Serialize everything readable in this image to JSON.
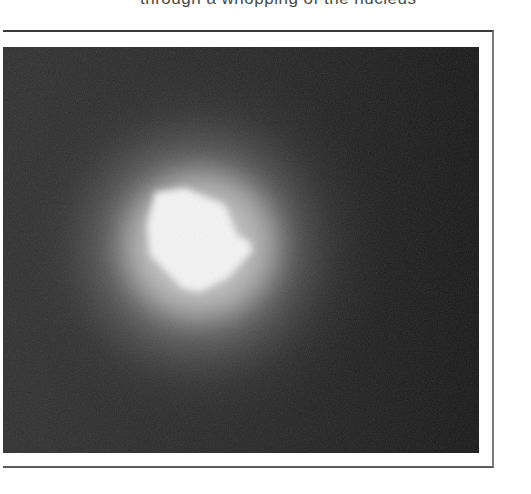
{
  "caption": {
    "text": "through a whopping of the nucleus",
    "clipped": true
  },
  "figure": {
    "colors": {
      "background_dark": "#1a1a1a",
      "background_left": "#2e2e2e",
      "glow": "#8c8c8c",
      "core": "#f4f4f4",
      "frame_border": "#3a3a3a",
      "page": "#ffffff"
    }
  }
}
